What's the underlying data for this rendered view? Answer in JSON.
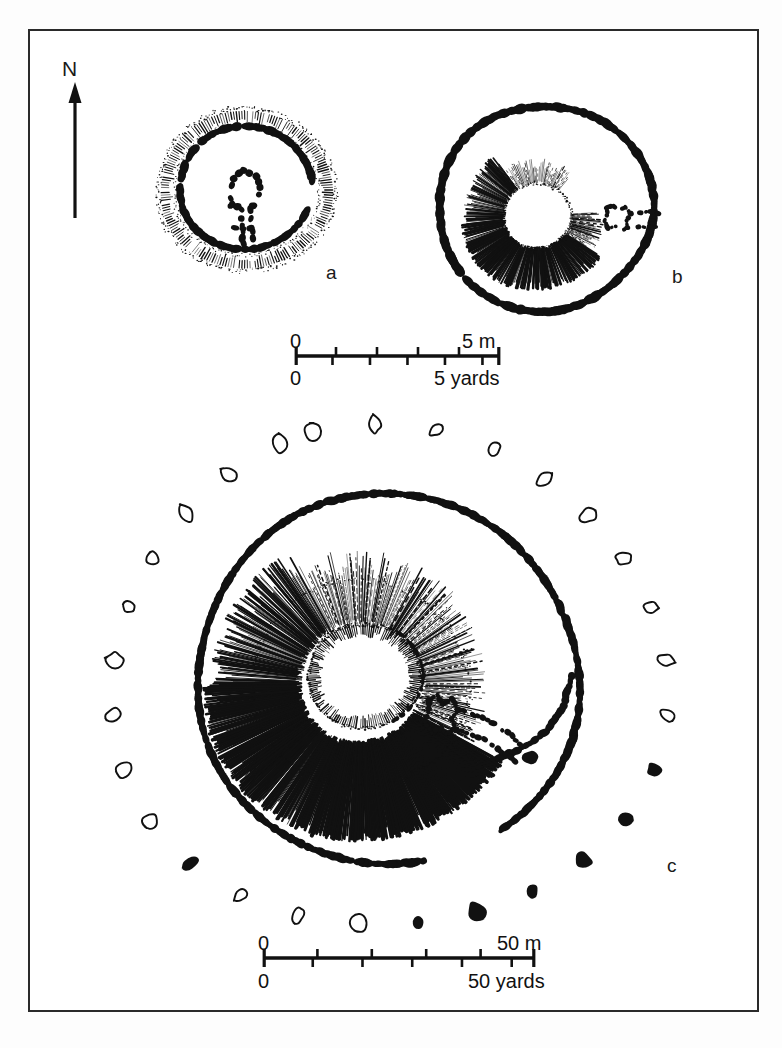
{
  "figure": {
    "kind": "archaeological-site-plan",
    "orientation_label": "N",
    "panels": [
      {
        "id": "a",
        "label": "a",
        "description": "small circular enclosure with hachured bank and internal stone setting"
      },
      {
        "id": "b",
        "label": "b",
        "description": "oval henge with inner hachured mound and eastern entrance passage"
      },
      {
        "id": "c",
        "label": "c",
        "description": "large henge with surrounding stone circle, inner mound and entrance passage"
      }
    ]
  },
  "scale_bars": [
    {
      "id": "scale-top",
      "for_panels": "a,b",
      "metric": {
        "start": "0",
        "end": "5 m",
        "start_value": 0,
        "end_value": 5,
        "unit": "m",
        "divisions": 5
      },
      "imperial": {
        "start": "0",
        "end": "5 yards",
        "start_value": 0,
        "end_value": 5,
        "unit": "yards",
        "divisions": 5
      }
    },
    {
      "id": "scale-bottom",
      "for_panels": "c",
      "metric": {
        "start": "0",
        "end": "50 m",
        "start_value": 0,
        "end_value": 50,
        "unit": "m",
        "divisions": 5
      },
      "imperial": {
        "start": "0",
        "end": "50 yards",
        "start_value": 0,
        "end_value": 50,
        "unit": "yards",
        "divisions": 5
      }
    }
  ],
  "labels": {
    "north": "N",
    "panel_a": "a",
    "panel_b": "b",
    "panel_c": "c",
    "sb1_metric_start": "0",
    "sb1_metric_end": "5 m",
    "sb1_imperial_start": "0",
    "sb1_imperial_end": "5 yards",
    "sb2_metric_start": "0",
    "sb2_metric_end": "50 m",
    "sb2_imperial_start": "0",
    "sb2_imperial_end": "50 yards"
  },
  "colors": {
    "ink": "#111111",
    "frame": "#2a2a2a",
    "paper": "#ffffff",
    "page": "#fdfdfd"
  },
  "geometry": {
    "frame": {
      "x": 28,
      "y": 29,
      "w": 731,
      "h": 983
    },
    "north_arrow": {
      "x": 75,
      "y": 85,
      "length": 130
    },
    "panel_a": {
      "cx": 246,
      "cy": 190,
      "outer_rx": 88,
      "outer_ry": 82
    },
    "panel_b": {
      "cx": 545,
      "cy": 208,
      "outer_rx": 108,
      "outer_ry": 102
    },
    "panel_c": {
      "cx": 388,
      "cy": 680,
      "outer_rx": 190,
      "outer_ry": 186,
      "stone_ring_rx": 278,
      "stone_ring_ry": 250
    },
    "scale_top": {
      "x1": 295,
      "x2": 500,
      "y": 356
    },
    "scale_bottom": {
      "x1": 263,
      "x2": 535,
      "y": 958
    }
  },
  "legend_semantics": {
    "filled_blob": "standing stone / surviving stone",
    "open_outline": "stone hole or fallen / destroyed stone",
    "hachure": "earthwork bank or mound slope",
    "dotted_line": "ditch or bank edge"
  }
}
